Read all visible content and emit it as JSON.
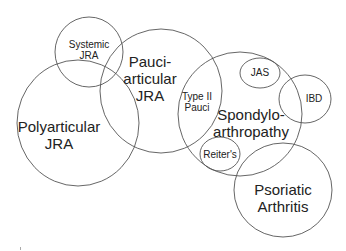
{
  "diagram": {
    "type": "venn",
    "stroke_color": "#555555",
    "text_color": "#222222",
    "sets": [
      {
        "id": "systemic",
        "lines": [
          "Systemic",
          "JRA"
        ],
        "cx": 89,
        "cy": 52,
        "rx": 34,
        "ry": 35,
        "label_x": 89,
        "label_y": 50,
        "font_size": 10
      },
      {
        "id": "polyarticular",
        "lines": [
          "Polyarticular",
          "JRA"
        ],
        "cx": 78,
        "cy": 123,
        "rx": 61,
        "ry": 63,
        "label_x": 59,
        "label_y": 136,
        "font_size": 15
      },
      {
        "id": "pauciarticular",
        "lines": [
          "Pauci-",
          "articular",
          "JRA"
        ],
        "cx": 161,
        "cy": 91,
        "rx": 61,
        "ry": 62,
        "label_x": 150,
        "label_y": 79,
        "font_size": 15
      },
      {
        "id": "spondyloarthropathy",
        "lines": [
          "Spondylo-",
          "arthropathy"
        ],
        "cx": 240,
        "cy": 114,
        "rx": 62,
        "ry": 62,
        "label_x": 251,
        "label_y": 124,
        "font_size": 15
      },
      {
        "id": "type2pauci",
        "lines": [
          "Type II",
          "Pauci"
        ],
        "label_x": 197,
        "label_y": 102,
        "font_size": 10,
        "region_only": true
      },
      {
        "id": "jas",
        "lines": [
          "JAS"
        ],
        "cx": 260,
        "cy": 73,
        "rx": 20,
        "ry": 15,
        "label_x": 260,
        "label_y": 73,
        "font_size": 10
      },
      {
        "id": "ibd",
        "lines": [
          "IBD"
        ],
        "cx": 305,
        "cy": 99,
        "rx": 26,
        "ry": 24,
        "label_x": 314,
        "label_y": 99,
        "font_size": 10
      },
      {
        "id": "reiters",
        "lines": [
          "Reiter's"
        ],
        "cx": 220,
        "cy": 154,
        "rx": 20,
        "ry": 17,
        "label_x": 220,
        "label_y": 155,
        "font_size": 10
      },
      {
        "id": "psoriatic",
        "lines": [
          "Psoriatic",
          "Arthritis"
        ],
        "cx": 283,
        "cy": 190,
        "rx": 49,
        "ry": 47,
        "label_x": 283,
        "label_y": 199,
        "font_size": 15
      }
    ]
  }
}
